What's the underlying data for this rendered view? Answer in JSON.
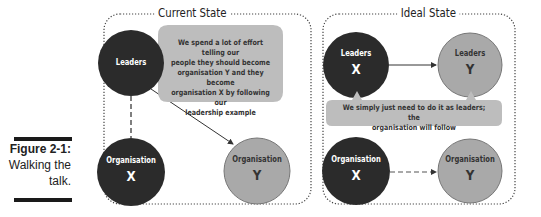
{
  "figure": {
    "number": "Figure 2-1:",
    "caption_line1": "Walking the",
    "caption_line2": "talk."
  },
  "colors": {
    "dark_node": "#2b2b2b",
    "light_node": "#a9a9a9",
    "bubble": "#bdbdbd",
    "border": "#333333"
  },
  "current_state": {
    "title": "Current State",
    "leaders": {
      "label": "Leaders",
      "letter": ""
    },
    "bubble_text": [
      "We spend a lot of effort telling our",
      "people they should become",
      "organisation Y and they become",
      "organisation X by following our",
      "leadership example"
    ],
    "org_x": {
      "label": "Organisation",
      "letter": "X"
    },
    "org_y": {
      "label": "Organisation",
      "letter": "Y"
    }
  },
  "ideal_state": {
    "title": "Ideal State",
    "leaders_x": {
      "label": "Leaders",
      "letter": "X"
    },
    "leaders_y": {
      "label": "Leaders",
      "letter": "Y"
    },
    "bubble_text": [
      "We simply just need to do it as leaders; the",
      "organisation will follow"
    ],
    "org_x": {
      "label": "Organisation",
      "letter": "X"
    },
    "org_y": {
      "label": "Organisation",
      "letter": "Y"
    }
  }
}
